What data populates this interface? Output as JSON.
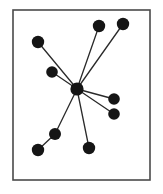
{
  "figure": {
    "background_color": "#ffffff",
    "ink_color": "#151515"
  },
  "frame": {
    "name": "diagram-border",
    "x": 13,
    "y": 10,
    "width": 137,
    "height": 170,
    "stroke_color": "#4a4a4a",
    "stroke_width": 1.6,
    "fill": "#ffffff"
  },
  "chart_data": {
    "type": "diagram",
    "graph_type": "star",
    "title": "",
    "xlabel": "",
    "ylabel": "",
    "node_count": 10,
    "edge_count": 9,
    "node_color": "#151515",
    "edge_color": "#2a2a2a",
    "node_radius_default": 6.0,
    "edge_width": 1.3,
    "nodes": [
      {
        "id": "hub",
        "label": "hub",
        "x": 77,
        "y": 89,
        "r": 6.6,
        "role": "center"
      },
      {
        "id": "n1",
        "label": "n1",
        "x": 38,
        "y": 42,
        "r": 6.2,
        "role": "leaf"
      },
      {
        "id": "n2",
        "label": "n2",
        "x": 52,
        "y": 72,
        "r": 5.8,
        "role": "leaf"
      },
      {
        "id": "n3",
        "label": "n3",
        "x": 99,
        "y": 26,
        "r": 6.2,
        "role": "leaf"
      },
      {
        "id": "n4",
        "label": "n4",
        "x": 123,
        "y": 24,
        "r": 6.2,
        "role": "leaf"
      },
      {
        "id": "n5",
        "label": "n5",
        "x": 114,
        "y": 99,
        "r": 5.8,
        "role": "leaf"
      },
      {
        "id": "n6",
        "label": "n6",
        "x": 114,
        "y": 114,
        "r": 5.8,
        "role": "leaf"
      },
      {
        "id": "n7",
        "label": "n7",
        "x": 89,
        "y": 148,
        "r": 6.2,
        "role": "leaf"
      },
      {
        "id": "n8",
        "label": "n8",
        "x": 55,
        "y": 134,
        "r": 6.0,
        "role": "intermediate"
      },
      {
        "id": "n9",
        "label": "n9",
        "x": 38,
        "y": 150,
        "r": 6.2,
        "role": "leaf"
      }
    ],
    "edges": [
      {
        "source": "hub",
        "target": "n1"
      },
      {
        "source": "hub",
        "target": "n2"
      },
      {
        "source": "hub",
        "target": "n3"
      },
      {
        "source": "hub",
        "target": "n4"
      },
      {
        "source": "hub",
        "target": "n5"
      },
      {
        "source": "hub",
        "target": "n6"
      },
      {
        "source": "hub",
        "target": "n7"
      },
      {
        "source": "hub",
        "target": "n8"
      },
      {
        "source": "n8",
        "target": "n9"
      }
    ]
  }
}
